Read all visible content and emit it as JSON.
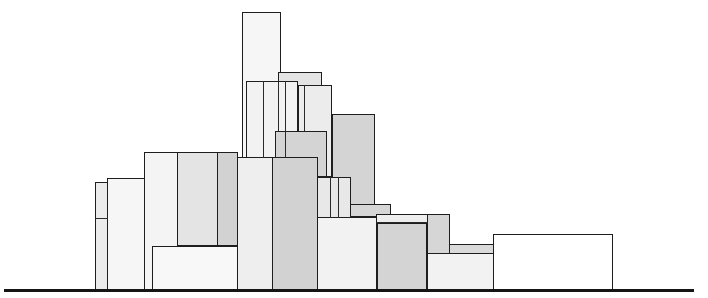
{
  "diagram": {
    "title": "",
    "canvas": {
      "width": 708,
      "height": 298,
      "background": "#ffffff"
    },
    "palette": {
      "white": "#ffffff",
      "very_light": "#f4f4f4",
      "light": "#ebebeb",
      "mid_light": "#e0e0e0",
      "mid": "#d6d6d6",
      "dark": "#cccccc",
      "stroke": "#1e1e1e"
    },
    "baseline": {
      "x": 4,
      "y": 289,
      "width": 690,
      "height": 3,
      "color": "#151515"
    },
    "blocks": [
      {
        "id": "tall-tower",
        "x": 242,
        "y": 12,
        "w": 39,
        "h": 146,
        "fill": "#f6f6f6"
      },
      {
        "id": "top-cap",
        "x": 278,
        "y": 72,
        "w": 44,
        "h": 14,
        "fill": "#e4e4e4"
      },
      {
        "id": "center-right-upper",
        "x": 298,
        "y": 85,
        "w": 34,
        "h": 92,
        "fill": "#ececec"
      },
      {
        "id": "right-gray-tall",
        "x": 332,
        "y": 114,
        "w": 43,
        "h": 101,
        "fill": "#d4d4d4"
      },
      {
        "id": "center-left-upper",
        "x": 246,
        "y": 81,
        "w": 52,
        "h": 77,
        "fill": "#f2f2f2"
      },
      {
        "id": "center-mid-gray",
        "x": 275,
        "y": 131,
        "w": 52,
        "h": 46,
        "fill": "#d4d4d4"
      },
      {
        "id": "left-narrow",
        "x": 95,
        "y": 182,
        "w": 13,
        "h": 108,
        "fill": "#ebebeb"
      },
      {
        "id": "left-wide",
        "x": 107,
        "y": 178,
        "w": 38,
        "h": 112,
        "fill": "#f6f6f6"
      },
      {
        "id": "left-main",
        "x": 144,
        "y": 152,
        "w": 94,
        "h": 138,
        "fill": "#f4f4f4"
      },
      {
        "id": "left-main-mid",
        "x": 177,
        "y": 152,
        "w": 41,
        "h": 94,
        "fill": "#e4e4e4"
      },
      {
        "id": "left-main-dark",
        "x": 217,
        "y": 152,
        "w": 21,
        "h": 94,
        "fill": "#d2d2d2"
      },
      {
        "id": "left-bottom",
        "x": 152,
        "y": 246,
        "w": 86,
        "h": 44,
        "fill": "#f8f8f8"
      },
      {
        "id": "center-light",
        "x": 237,
        "y": 157,
        "w": 36,
        "h": 133,
        "fill": "#eeeeee"
      },
      {
        "id": "center-gray",
        "x": 272,
        "y": 157,
        "w": 46,
        "h": 133,
        "fill": "#d2d2d2"
      },
      {
        "id": "center-small-stack",
        "x": 317,
        "y": 177,
        "w": 34,
        "h": 41,
        "fill": "#e8e8e8"
      },
      {
        "id": "gray-step",
        "x": 350,
        "y": 204,
        "w": 41,
        "h": 13,
        "fill": "#d6d6d6"
      },
      {
        "id": "right-light-low",
        "x": 317,
        "y": 217,
        "w": 60,
        "h": 73,
        "fill": "#f2f2f2"
      },
      {
        "id": "right-strip",
        "x": 376,
        "y": 214,
        "w": 52,
        "h": 76,
        "fill": "#eeeeee"
      },
      {
        "id": "right-strip-gray",
        "x": 377,
        "y": 223,
        "w": 50,
        "h": 67,
        "fill": "#d4d4d4"
      },
      {
        "id": "far-right-gray",
        "x": 427,
        "y": 214,
        "w": 23,
        "h": 40,
        "fill": "#d6d6d6"
      },
      {
        "id": "far-right-thin",
        "x": 449,
        "y": 244,
        "w": 45,
        "h": 10,
        "fill": "#dadada"
      },
      {
        "id": "far-right-low",
        "x": 427,
        "y": 253,
        "w": 67,
        "h": 37,
        "fill": "#f2f2f2"
      },
      {
        "id": "far-right-white",
        "x": 493,
        "y": 234,
        "w": 120,
        "h": 56,
        "fill": "#ffffff"
      }
    ],
    "divider_lines": [
      {
        "type": "h",
        "x": 95,
        "y": 218,
        "len": 13
      },
      {
        "type": "v",
        "x": 263,
        "y": 81,
        "len": 77
      },
      {
        "type": "v",
        "x": 278,
        "y": 81,
        "len": 50
      },
      {
        "type": "v",
        "x": 285,
        "y": 81,
        "len": 50
      },
      {
        "type": "v",
        "x": 304,
        "y": 85,
        "len": 46
      },
      {
        "type": "v",
        "x": 285,
        "y": 131,
        "len": 26
      },
      {
        "type": "v",
        "x": 330,
        "y": 177,
        "len": 41
      },
      {
        "type": "v",
        "x": 338,
        "y": 177,
        "len": 41
      },
      {
        "type": "h",
        "x": 376,
        "y": 222,
        "len": 52
      }
    ]
  }
}
